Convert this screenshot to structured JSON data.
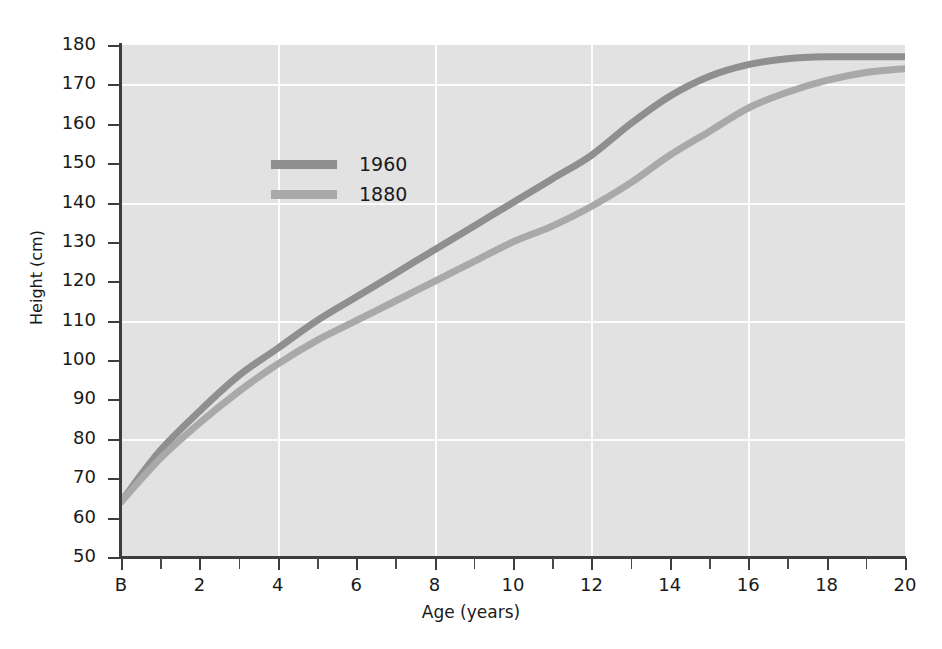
{
  "chart_data": {
    "type": "line",
    "title": "",
    "xlabel": "Age (years)",
    "ylabel": "Height (cm)",
    "xlim": [
      0,
      20
    ],
    "ylim": [
      50,
      180
    ],
    "grid": true,
    "grid_color": "#fdfdfd",
    "plot_background": "#e2e2e2",
    "legend_position": "upper-left",
    "x_tick_labels": [
      "B",
      "2",
      "4",
      "6",
      "8",
      "10",
      "12",
      "14",
      "16",
      "18",
      "20"
    ],
    "x_tick_values": [
      0,
      2,
      4,
      6,
      8,
      10,
      12,
      14,
      16,
      18,
      20
    ],
    "x_minor_ticks": [
      1,
      3,
      5,
      7,
      9,
      11,
      13,
      15,
      17,
      19
    ],
    "y_tick_labels": [
      "50",
      "60",
      "70",
      "80",
      "90",
      "100",
      "110",
      "120",
      "130",
      "140",
      "150",
      "160",
      "170",
      "180"
    ],
    "y_tick_values": [
      50,
      60,
      70,
      80,
      90,
      100,
      110,
      120,
      130,
      140,
      150,
      160,
      170,
      180
    ],
    "y_gridlines": [
      80,
      110,
      140,
      170
    ],
    "x_gridlines": [
      4,
      8,
      12,
      16
    ],
    "x": [
      0,
      1,
      2,
      3,
      4,
      5,
      6,
      7,
      8,
      9,
      10,
      11,
      12,
      13,
      14,
      15,
      16,
      17,
      18,
      19,
      20
    ],
    "series": [
      {
        "name": "1960",
        "color": "#8f8f8f",
        "values": [
          64,
          77,
          87,
          96,
          103,
          110,
          116,
          122,
          128,
          134,
          140,
          146,
          152,
          160,
          167,
          172,
          175,
          176.5,
          177,
          177,
          177
        ]
      },
      {
        "name": "1880",
        "color": "#a9a9a9",
        "values": [
          64,
          75,
          84,
          92,
          99,
          105,
          110,
          115,
          120,
          125,
          130,
          134,
          139,
          145,
          152,
          158,
          164,
          168,
          171,
          173,
          174
        ]
      }
    ]
  },
  "legend": {
    "items": [
      {
        "label": "1960",
        "color": "#8f8f8f"
      },
      {
        "label": "1880",
        "color": "#a9a9a9"
      }
    ]
  },
  "axes": {
    "y_title": "Height (cm)",
    "x_title": "Age (years)"
  }
}
